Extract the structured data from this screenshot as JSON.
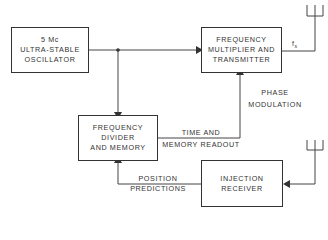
{
  "blocks": {
    "oscillator": {
      "lines": [
        "5 Mc",
        "ULTRA-STABLE",
        "OSCILLATOR"
      ]
    },
    "multiplier": {
      "lines": [
        "FREQUENCY",
        "MULTIPLIER AND",
        "TRANSMITTER"
      ]
    },
    "divider": {
      "lines": [
        "FREQUENCY",
        "DIVIDER",
        "AND MEMORY"
      ]
    },
    "receiver": {
      "lines": [
        "INJECTION",
        "RECEIVER"
      ]
    }
  },
  "labels": {
    "fs": "f",
    "fs_sub": "s",
    "phase_modulation": [
      "PHASE",
      "MODULATION"
    ],
    "time_memory": [
      "TIME AND",
      "MEMORY READOUT"
    ],
    "position_predictions": [
      "POSITION",
      "PREDICTIONS"
    ]
  }
}
